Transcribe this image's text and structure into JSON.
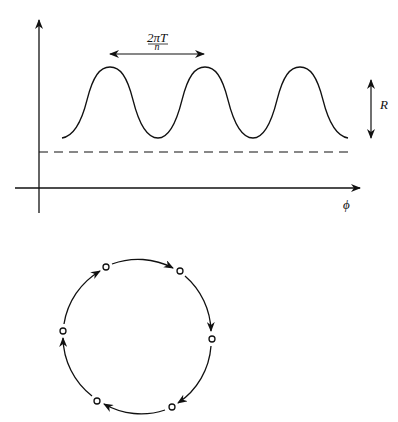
{
  "top_plot": {
    "period_label_num": "2πT",
    "period_label_den": "n",
    "amplitude_label": "R",
    "x_axis_label": "ϕ",
    "waveform": "periodic oscillation with 3 peaks above a dashed baseline"
  },
  "cycle_diagram": {
    "node_count": 6,
    "direction": "clockwise",
    "description": "ring of 6 states connected by arrows"
  },
  "colors": {
    "ink": "#111111",
    "background": "#ffffff"
  }
}
